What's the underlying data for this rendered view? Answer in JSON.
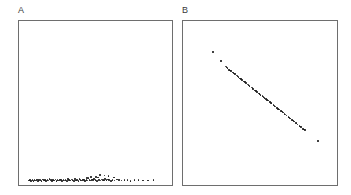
{
  "figure": {
    "background_color": "#ffffff",
    "border_color": "#6e6e6e",
    "point_color": "#1a1a1a"
  },
  "panels": [
    {
      "label": "A",
      "name": "panel-a"
    },
    {
      "label": "B",
      "name": "panel-b"
    }
  ],
  "chart_data": [
    {
      "type": "scatter",
      "title": "A",
      "xlabel": "",
      "ylabel": "",
      "xlim": [
        0,
        1
      ],
      "ylim": [
        0,
        1
      ],
      "grid": false,
      "legend": "none",
      "marker_color": "#1a1a1a",
      "description": "Dense horizontal band of points hugging the bottom axis, concentrated in the left-to-center region with a sparse tail extending right.",
      "points": [
        [
          0.065,
          0.028
        ],
        [
          0.072,
          0.03
        ],
        [
          0.08,
          0.026
        ],
        [
          0.088,
          0.032
        ],
        [
          0.095,
          0.024
        ],
        [
          0.102,
          0.03
        ],
        [
          0.11,
          0.027
        ],
        [
          0.118,
          0.033
        ],
        [
          0.125,
          0.025
        ],
        [
          0.132,
          0.029
        ],
        [
          0.14,
          0.031
        ],
        [
          0.148,
          0.026
        ],
        [
          0.155,
          0.034
        ],
        [
          0.162,
          0.028
        ],
        [
          0.17,
          0.03
        ],
        [
          0.178,
          0.024
        ],
        [
          0.185,
          0.032
        ],
        [
          0.193,
          0.027
        ],
        [
          0.2,
          0.035
        ],
        [
          0.208,
          0.029
        ],
        [
          0.215,
          0.026
        ],
        [
          0.222,
          0.031
        ],
        [
          0.23,
          0.028
        ],
        [
          0.238,
          0.033
        ],
        [
          0.245,
          0.025
        ],
        [
          0.252,
          0.03
        ],
        [
          0.26,
          0.027
        ],
        [
          0.268,
          0.034
        ],
        [
          0.275,
          0.029
        ],
        [
          0.282,
          0.026
        ],
        [
          0.29,
          0.032
        ],
        [
          0.298,
          0.028
        ],
        [
          0.305,
          0.031
        ],
        [
          0.312,
          0.024
        ],
        [
          0.32,
          0.036
        ],
        [
          0.328,
          0.029
        ],
        [
          0.335,
          0.027
        ],
        [
          0.342,
          0.033
        ],
        [
          0.35,
          0.03
        ],
        [
          0.358,
          0.026
        ],
        [
          0.365,
          0.035
        ],
        [
          0.372,
          0.028
        ],
        [
          0.38,
          0.031
        ],
        [
          0.388,
          0.025
        ],
        [
          0.395,
          0.038
        ],
        [
          0.402,
          0.029
        ],
        [
          0.41,
          0.027
        ],
        [
          0.418,
          0.034
        ],
        [
          0.425,
          0.03
        ],
        [
          0.432,
          0.026
        ],
        [
          0.44,
          0.032
        ],
        [
          0.448,
          0.028
        ],
        [
          0.455,
          0.041
        ],
        [
          0.462,
          0.03
        ],
        [
          0.47,
          0.027
        ],
        [
          0.478,
          0.033
        ],
        [
          0.485,
          0.029
        ],
        [
          0.492,
          0.036
        ],
        [
          0.5,
          0.031
        ],
        [
          0.508,
          0.026
        ],
        [
          0.516,
          0.045
        ],
        [
          0.524,
          0.03
        ],
        [
          0.532,
          0.028
        ],
        [
          0.54,
          0.034
        ],
        [
          0.548,
          0.031
        ],
        [
          0.556,
          0.027
        ],
        [
          0.564,
          0.038
        ],
        [
          0.572,
          0.029
        ],
        [
          0.58,
          0.033
        ],
        [
          0.59,
          0.03
        ],
        [
          0.6,
          0.026
        ],
        [
          0.612,
          0.031
        ],
        [
          0.625,
          0.028
        ],
        [
          0.64,
          0.034
        ],
        [
          0.655,
          0.029
        ],
        [
          0.67,
          0.027
        ],
        [
          0.69,
          0.032
        ],
        [
          0.71,
          0.03
        ],
        [
          0.73,
          0.026
        ],
        [
          0.755,
          0.029
        ],
        [
          0.78,
          0.031
        ],
        [
          0.81,
          0.028
        ],
        [
          0.845,
          0.027
        ],
        [
          0.88,
          0.03
        ],
        [
          0.53,
          0.062
        ],
        [
          0.56,
          0.058
        ],
        [
          0.585,
          0.055
        ],
        [
          0.505,
          0.05
        ],
        [
          0.47,
          0.048
        ],
        [
          0.62,
          0.046
        ],
        [
          0.445,
          0.044
        ]
      ]
    },
    {
      "type": "scatter",
      "title": "B",
      "xlabel": "",
      "ylabel": "",
      "xlim": [
        0,
        1
      ],
      "ylim": [
        0,
        1
      ],
      "grid": false,
      "legend": "none",
      "marker_color": "#1a1a1a",
      "description": "Tight negatively-sloped diagonal band of densely overlapping points running from upper-left to lower-right, with two detached outliers above-left of the band and one detached outlier below-right of its lower end.",
      "points": [
        [
          0.195,
          0.81
        ],
        [
          0.245,
          0.755
        ],
        [
          0.275,
          0.722
        ],
        [
          0.288,
          0.712
        ],
        [
          0.3,
          0.703
        ],
        [
          0.312,
          0.694
        ],
        [
          0.324,
          0.685
        ],
        [
          0.336,
          0.676
        ],
        [
          0.348,
          0.667
        ],
        [
          0.36,
          0.658
        ],
        [
          0.372,
          0.649
        ],
        [
          0.384,
          0.64
        ],
        [
          0.396,
          0.631
        ],
        [
          0.408,
          0.622
        ],
        [
          0.42,
          0.613
        ],
        [
          0.432,
          0.604
        ],
        [
          0.444,
          0.595
        ],
        [
          0.456,
          0.586
        ],
        [
          0.468,
          0.577
        ],
        [
          0.48,
          0.568
        ],
        [
          0.492,
          0.559
        ],
        [
          0.504,
          0.55
        ],
        [
          0.516,
          0.541
        ],
        [
          0.528,
          0.532
        ],
        [
          0.54,
          0.523
        ],
        [
          0.552,
          0.514
        ],
        [
          0.564,
          0.505
        ],
        [
          0.576,
          0.496
        ],
        [
          0.588,
          0.487
        ],
        [
          0.6,
          0.478
        ],
        [
          0.612,
          0.469
        ],
        [
          0.624,
          0.46
        ],
        [
          0.636,
          0.451
        ],
        [
          0.648,
          0.442
        ],
        [
          0.66,
          0.433
        ],
        [
          0.672,
          0.424
        ],
        [
          0.684,
          0.415
        ],
        [
          0.696,
          0.406
        ],
        [
          0.708,
          0.397
        ],
        [
          0.72,
          0.388
        ],
        [
          0.732,
          0.379
        ],
        [
          0.744,
          0.37
        ],
        [
          0.756,
          0.361
        ],
        [
          0.768,
          0.352
        ],
        [
          0.78,
          0.343
        ],
        [
          0.792,
          0.334
        ],
        [
          0.282,
          0.718
        ],
        [
          0.306,
          0.699
        ],
        [
          0.33,
          0.681
        ],
        [
          0.354,
          0.663
        ],
        [
          0.378,
          0.645
        ],
        [
          0.402,
          0.627
        ],
        [
          0.426,
          0.609
        ],
        [
          0.45,
          0.591
        ],
        [
          0.474,
          0.573
        ],
        [
          0.498,
          0.555
        ],
        [
          0.522,
          0.537
        ],
        [
          0.546,
          0.519
        ],
        [
          0.57,
          0.501
        ],
        [
          0.594,
          0.483
        ],
        [
          0.618,
          0.465
        ],
        [
          0.642,
          0.447
        ],
        [
          0.666,
          0.429
        ],
        [
          0.69,
          0.411
        ],
        [
          0.714,
          0.393
        ],
        [
          0.738,
          0.375
        ],
        [
          0.762,
          0.357
        ],
        [
          0.786,
          0.339
        ],
        [
          0.878,
          0.268
        ]
      ]
    }
  ]
}
